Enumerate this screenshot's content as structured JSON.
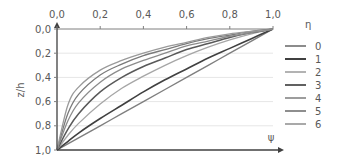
{
  "chart_data": {
    "type": "line",
    "title": "",
    "xlabel": "ψ",
    "ylabel": "z/h",
    "xlim": [
      0.0,
      1.0
    ],
    "ylim": [
      1.0,
      0.0
    ],
    "y_inverted": true,
    "x_axis_position": "top",
    "x_ticks": [
      "0,0",
      "0,2",
      "0,4",
      "0,6",
      "0,8",
      "1,0"
    ],
    "y_ticks": [
      "0,0",
      "0,2",
      "0,4",
      "0,6",
      "0,8",
      "1,0"
    ],
    "grid": "horizontal",
    "legend_title": "η",
    "legend_position": "right",
    "x": [
      0.0,
      0.05,
      0.1,
      0.2,
      0.3,
      0.4,
      0.5,
      0.6,
      0.7,
      0.8,
      0.9,
      1.0
    ],
    "series": [
      {
        "name": "0",
        "color": "#7f7f7f",
        "width": 1.4,
        "values": [
          1.0,
          0.95,
          0.9,
          0.8,
          0.7,
          0.6,
          0.5,
          0.4,
          0.3,
          0.2,
          0.1,
          0.0
        ]
      },
      {
        "name": "1",
        "color": "#404040",
        "width": 1.6,
        "values": [
          1.0,
          0.93,
          0.86,
          0.74,
          0.63,
          0.52,
          0.42,
          0.33,
          0.24,
          0.16,
          0.08,
          0.0
        ]
      },
      {
        "name": "2",
        "color": "#a6a6a6",
        "width": 1.3,
        "values": [
          1.0,
          0.88,
          0.78,
          0.62,
          0.49,
          0.39,
          0.3,
          0.22,
          0.15,
          0.09,
          0.04,
          0.0
        ]
      },
      {
        "name": "3",
        "color": "#595959",
        "width": 1.5,
        "values": [
          1.0,
          0.83,
          0.7,
          0.52,
          0.4,
          0.31,
          0.24,
          0.17,
          0.12,
          0.07,
          0.03,
          0.0
        ]
      },
      {
        "name": "4",
        "color": "#8c8c8c",
        "width": 1.3,
        "values": [
          1.0,
          0.76,
          0.61,
          0.44,
          0.33,
          0.26,
          0.2,
          0.14,
          0.1,
          0.06,
          0.03,
          0.0
        ]
      },
      {
        "name": "5",
        "color": "#7a7a7a",
        "width": 1.3,
        "values": [
          1.0,
          0.7,
          0.54,
          0.38,
          0.29,
          0.22,
          0.17,
          0.12,
          0.08,
          0.05,
          0.02,
          0.0
        ]
      },
      {
        "name": "6",
        "color": "#9a9a9a",
        "width": 1.3,
        "values": [
          1.0,
          0.63,
          0.48,
          0.34,
          0.26,
          0.2,
          0.15,
          0.11,
          0.07,
          0.04,
          0.02,
          0.0
        ]
      }
    ]
  },
  "layout": {
    "plot_left": 57,
    "plot_right": 273,
    "plot_top": 29,
    "plot_bottom": 150,
    "axis_color": "#404040",
    "grid_color": "#e6e6e6"
  }
}
